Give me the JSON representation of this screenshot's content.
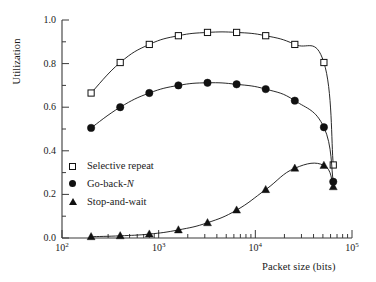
{
  "chart_data": {
    "type": "line",
    "title": "",
    "xlabel": "Packet size (bits)",
    "ylabel": "Utilization",
    "xscale": "log",
    "yscale": "linear",
    "xlim": [
      100,
      100000
    ],
    "ylim": [
      0.0,
      1.0
    ],
    "grid": false,
    "legend_position": "inside-lower-left",
    "xticks": [
      100,
      1000,
      10000,
      100000
    ],
    "xtick_labels": [
      "10",
      "10",
      "10",
      "10"
    ],
    "xtick_exponents": [
      "2",
      "3",
      "4",
      "5"
    ],
    "yticks": [
      0.0,
      0.2,
      0.4,
      0.6,
      0.8,
      1.0
    ],
    "ytick_labels": [
      "0.0",
      "0.2",
      "0.4",
      "0.6",
      "0.8",
      "1.0"
    ],
    "yminor_step": 0.1,
    "series": [
      {
        "name": "Selective repeat",
        "marker": "open-square",
        "color": "#111111",
        "x": [
          200,
          400,
          800,
          1600,
          3200,
          6400,
          12800,
          25600,
          51200,
          64000
        ],
        "values": [
          0.665,
          0.805,
          0.888,
          0.928,
          0.943,
          0.943,
          0.928,
          0.888,
          0.805,
          0.335
        ]
      },
      {
        "name": "Go-back-N",
        "marker": "filled-circle",
        "color": "#111111",
        "x": [
          200,
          400,
          800,
          1600,
          3200,
          6400,
          12800,
          25600,
          51200,
          64000
        ],
        "values": [
          0.505,
          0.6,
          0.665,
          0.7,
          0.712,
          0.705,
          0.683,
          0.63,
          0.508,
          0.258
        ]
      },
      {
        "name": "Stop-and-wait",
        "marker": "filled-triangle",
        "color": "#111111",
        "x": [
          200,
          400,
          800,
          1600,
          3200,
          6400,
          12800,
          25600,
          51200,
          64000
        ],
        "values": [
          0.006,
          0.01,
          0.018,
          0.037,
          0.07,
          0.128,
          0.222,
          0.32,
          0.333,
          0.235
        ]
      }
    ]
  },
  "legend": {
    "items": [
      {
        "label": "Selective repeat",
        "marker": "open-square"
      },
      {
        "label": "Go-back-",
        "label_italic": "N",
        "marker": "filled-circle"
      },
      {
        "label": "Stop-and-wait",
        "marker": "filled-triangle"
      }
    ]
  },
  "axes": {
    "y_title": "Utilization",
    "x_title": "Packet size (bits)"
  }
}
